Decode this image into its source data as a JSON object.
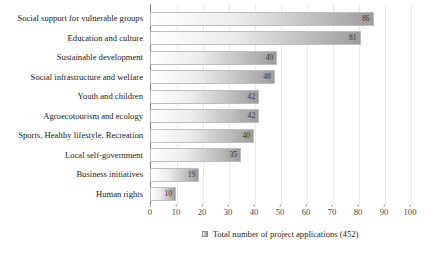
{
  "chart_data": {
    "type": "bar",
    "orientation": "horizontal",
    "title": "",
    "categories": [
      "Social support for vulnerable groups",
      "Education and culture",
      "Sustainable development",
      "Social infrastructure and welfare",
      "Youth and children",
      "Agroecotourism and ecology",
      "Sports, Healthy lifestyle, Recreation",
      "Local self-government",
      "Business initiatives",
      "Human rights"
    ],
    "values": [
      86,
      81,
      49,
      48,
      42,
      42,
      40,
      35,
      19,
      10
    ],
    "xlabel": "",
    "ylabel": "",
    "xlim": [
      0,
      100
    ],
    "x_ticks": [
      0,
      10,
      20,
      30,
      40,
      50,
      60,
      70,
      80,
      90,
      100
    ],
    "grid": "vertical",
    "legend_position": "bottom",
    "legend": "Total number of project applications (452)"
  },
  "colors": {
    "background": "#ffffff",
    "bar_gradient_start": "#ffffff",
    "bar_gradient_end": "#9c9c9c",
    "axis_line": "#7f7f7f",
    "gridline": "#eaeaea",
    "label_text": "#1a1a1a",
    "tick_text": "#474747",
    "value_text": "#333333"
  }
}
